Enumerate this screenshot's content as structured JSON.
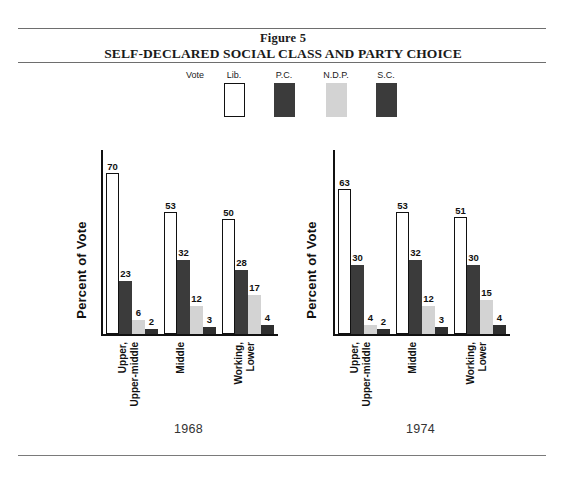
{
  "figure": {
    "label": "Figure 5",
    "title": "SELF-DECLARED SOCIAL CLASS AND PARTY CHOICE"
  },
  "legend": {
    "caption": "Vote",
    "entries": [
      {
        "label": "Lib.",
        "color": "#ffffff",
        "style": "outline"
      },
      {
        "label": "P.C.",
        "color": "#3b3b3b",
        "style": "solid"
      },
      {
        "label": "N.D.P.",
        "color": "#d3d3d3",
        "style": "solid"
      },
      {
        "label": "S.C.",
        "color": "#3b3b3b",
        "style": "solid"
      }
    ]
  },
  "chart_data": [
    {
      "type": "bar",
      "title": "1968",
      "xlabel": "",
      "ylabel": "Percent of Vote",
      "ylim": [
        0,
        80
      ],
      "grid": false,
      "legend_position": "top-center",
      "categories": [
        "Upper, Upper-middle",
        "Middle",
        "Working, Lower"
      ],
      "category_lines": [
        [
          "Upper,",
          "Upper-middle"
        ],
        [
          "Middle"
        ],
        [
          "Working,",
          "Lower"
        ]
      ],
      "series": [
        {
          "name": "Lib.",
          "color": "#ffffff",
          "values": [
            70,
            53,
            50
          ]
        },
        {
          "name": "P.C.",
          "color": "#3b3b3b",
          "values": [
            23,
            32,
            28
          ]
        },
        {
          "name": "N.D.P.",
          "color": "#d3d3d3",
          "values": [
            6,
            12,
            17
          ]
        },
        {
          "name": "S.C.",
          "color": "#2f2f2f",
          "values": [
            2,
            3,
            4
          ]
        }
      ]
    },
    {
      "type": "bar",
      "title": "1974",
      "xlabel": "",
      "ylabel": "Percent of Vote",
      "ylim": [
        0,
        80
      ],
      "grid": false,
      "legend_position": "top-center",
      "categories": [
        "Upper, Upper-middle",
        "Middle",
        "Working, Lower"
      ],
      "category_lines": [
        [
          "Upper,",
          "Upper-middle"
        ],
        [
          "Middle"
        ],
        [
          "Working,",
          "Lower"
        ]
      ],
      "series": [
        {
          "name": "Lib.",
          "color": "#ffffff",
          "values": [
            63,
            53,
            51
          ]
        },
        {
          "name": "P.C.",
          "color": "#3b3b3b",
          "values": [
            30,
            32,
            30
          ]
        },
        {
          "name": "N.D.P.",
          "color": "#d3d3d3",
          "values": [
            4,
            12,
            15
          ]
        },
        {
          "name": "S.C.",
          "color": "#2f2f2f",
          "values": [
            2,
            3,
            4
          ]
        }
      ]
    }
  ]
}
